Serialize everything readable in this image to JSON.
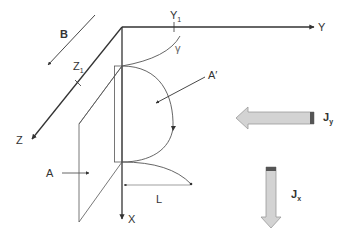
{
  "diagram": {
    "type": "coordinate-system-with-regions",
    "axes": {
      "x": {
        "label": "X"
      },
      "y": {
        "label": "Y",
        "tick_label": "Y",
        "tick_sub": "1"
      },
      "z": {
        "label": "Z",
        "tick_label": "Z",
        "tick_sub": "1"
      }
    },
    "field": {
      "label": "B"
    },
    "curve": {
      "label": "γ"
    },
    "region_a": {
      "label": "A"
    },
    "region_a_prime": {
      "label": "A′"
    },
    "dimension": {
      "label": "L"
    },
    "currents": {
      "jy": {
        "label": "J",
        "sub": "y"
      },
      "jx": {
        "label": "J",
        "sub": "x"
      }
    },
    "colors": {
      "line": "#333333",
      "arrow_fill": "#d3d3d3",
      "arrow_stroke": "#9a9a9a",
      "arrow_cap": "#555555"
    }
  }
}
